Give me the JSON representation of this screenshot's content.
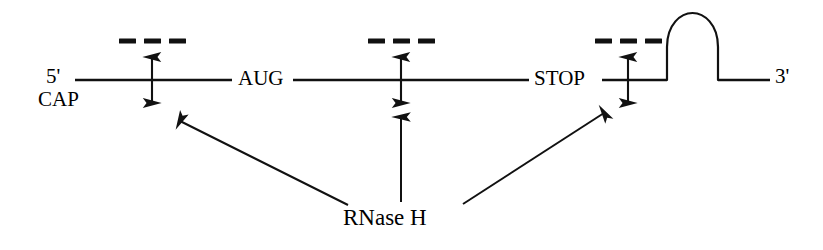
{
  "diagram": {
    "type": "molecular-biology-schematic",
    "colors": {
      "stroke": "#111111",
      "background": "#ffffff"
    },
    "mrna_strand": {
      "name": "mRNA backbone",
      "y": 80,
      "x_start": 75,
      "x_end": 770,
      "stroke_width": 2.4
    },
    "labels": {
      "five_prime": "5'",
      "cap": "CAP",
      "start_codon": "AUG",
      "stop_codon": "STOP",
      "three_prime": "3'",
      "enzyme": "RNase H"
    },
    "cleavage_sites": [
      {
        "id": "site-5utr",
        "name": "cleavage-site-5utr",
        "x": 152,
        "oligo_dashes_y": 41,
        "oligo_dash_count": 3,
        "arrow_top_y": 54,
        "arrow_bottom_y": 106
      },
      {
        "id": "site-coding",
        "name": "cleavage-site-coding",
        "x": 401,
        "oligo_dashes_y": 41,
        "oligo_dash_count": 3,
        "arrow_top_y": 54,
        "arrow_bottom_y": 106
      },
      {
        "id": "site-3utr",
        "name": "cleavage-site-3utr",
        "x": 628,
        "oligo_dashes_y": 41,
        "oligo_dash_count": 3,
        "arrow_top_y": 54,
        "arrow_bottom_y": 106
      }
    ],
    "oligo_dash": {
      "width": 17,
      "gap": 8,
      "thickness": 5
    },
    "stem_loop": {
      "name": "hairpin-stem-loop",
      "stem_left_x": 667,
      "stem_right_x": 718,
      "base_y": 80,
      "neck_y": 47,
      "loop_top_y": 13
    },
    "pointer_arrows": [
      {
        "id": "pointer-left",
        "name": "rnaseh-pointer-left",
        "from_x": 348,
        "from_y": 205,
        "to_x": 177,
        "to_y": 119
      },
      {
        "id": "pointer-middle",
        "name": "rnaseh-pointer-middle",
        "from_x": 401,
        "from_y": 202,
        "to_x": 401,
        "to_y": 114
      },
      {
        "id": "pointer-right",
        "name": "rnaseh-pointer-right",
        "from_x": 463,
        "from_y": 204,
        "to_x": 607,
        "to_y": 111
      }
    ]
  }
}
